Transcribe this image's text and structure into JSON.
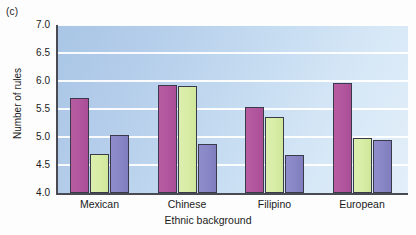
{
  "panel": {
    "label": "(c)"
  },
  "chart_data": {
    "type": "bar",
    "title": "",
    "subtitle": "",
    "xlabel": "Ethnic background",
    "ylabel": "Number of rules",
    "categories": [
      "Mexican",
      "Chinese",
      "Filipino",
      "European"
    ],
    "series": [
      {
        "name": "series-1",
        "color": "#b257a0",
        "values": [
          5.7,
          5.93,
          5.53,
          5.97
        ]
      },
      {
        "name": "series-2",
        "color": "#d8eda6",
        "values": [
          4.7,
          5.91,
          5.35,
          4.98
        ]
      },
      {
        "name": "series-3",
        "color": "#8a87c6",
        "values": [
          5.04,
          4.88,
          4.68,
          4.95
        ]
      }
    ],
    "ylim": [
      4.0,
      7.0
    ],
    "ytick_labels": [
      "4.0",
      "4.5",
      "5.0",
      "5.5",
      "6.0",
      "6.5",
      "7.0"
    ],
    "ytick_values": [
      4.0,
      4.5,
      5.0,
      5.5,
      6.0,
      6.5,
      7.0
    ],
    "grid": true,
    "grid_color": "#ffffff",
    "legend": "none",
    "plot_background": "light-blue-gradient"
  }
}
